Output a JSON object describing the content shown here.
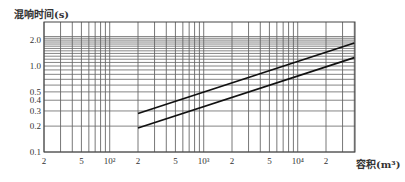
{
  "chart_data": {
    "type": "line",
    "title": "",
    "ylabel": "混响时间(s)",
    "xlabel": "容积(m³)",
    "x_scale": "log",
    "y_scale": "log",
    "xlim": [
      20,
      40000
    ],
    "ylim": [
      0.1,
      3.0
    ],
    "grid": true,
    "x_tick_labels": [
      "2",
      "5",
      "10²",
      "2",
      "5",
      "10³",
      "2",
      "5",
      "10⁴",
      "2"
    ],
    "x_tick_values": [
      20,
      50,
      100,
      200,
      500,
      1000,
      2000,
      5000,
      10000,
      20000
    ],
    "y_tick_labels": [
      "2.0",
      "1.0",
      "0.5",
      "0.4",
      "0.3",
      "0.2",
      "0.1"
    ],
    "y_tick_values": [
      2.0,
      1.0,
      0.5,
      0.4,
      0.3,
      0.2,
      0.1
    ],
    "series": [
      {
        "name": "upper limit",
        "x": [
          200,
          40000
        ],
        "y": [
          0.28,
          1.85
        ]
      },
      {
        "name": "lower limit",
        "x": [
          200,
          40000
        ],
        "y": [
          0.19,
          1.25
        ]
      }
    ],
    "legend": "none"
  },
  "labels": {
    "y_axis_title": "混响时间(s)",
    "x_axis_title": "容积(m³)"
  }
}
